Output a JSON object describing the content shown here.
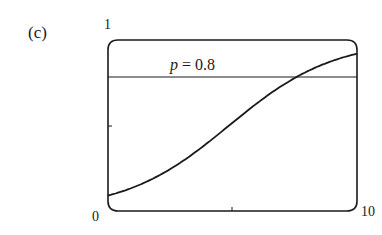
{
  "panel_label": "(c)",
  "y_top_label": "1",
  "x_left_label": "0",
  "x_right_label": "10",
  "annotation": {
    "var": "p",
    "eq": " = 0.8"
  },
  "chart_data": {
    "type": "line",
    "title": "",
    "panel": "(c)",
    "xlabel": "",
    "ylabel": "",
    "xlim": [
      0,
      10
    ],
    "ylim": [
      0,
      1
    ],
    "x_ticks": [
      0,
      5,
      10
    ],
    "x_tick_labels": [
      "0",
      "",
      "10"
    ],
    "y_ticks": [
      0,
      0.5,
      1
    ],
    "y_tick_labels": [
      "0",
      "",
      "1"
    ],
    "grid": false,
    "series": [
      {
        "name": "logistic curve",
        "x": [
          0,
          1,
          2,
          3,
          4,
          5,
          6,
          7,
          8,
          9,
          10
        ],
        "y": [
          0.09,
          0.14,
          0.21,
          0.3,
          0.41,
          0.52,
          0.63,
          0.73,
          0.81,
          0.87,
          0.92
        ]
      }
    ],
    "reference_lines": [
      {
        "orientation": "horizontal",
        "y": 0.8,
        "label": "p = 0.8"
      }
    ]
  }
}
